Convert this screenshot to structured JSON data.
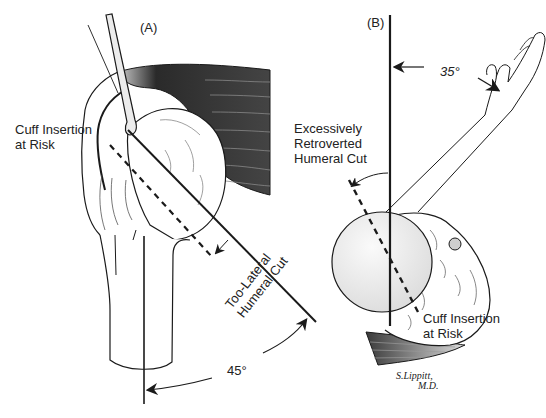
{
  "figure": {
    "panels": [
      {
        "id": "A",
        "label": "(A)",
        "annotations": {
          "cuff_line1": "Cuff Insertion",
          "cuff_line2": "at Risk",
          "cut_line1": "Too-Lateral",
          "cut_line2": "Humeral Cut",
          "angle": "45°"
        }
      },
      {
        "id": "B",
        "label": "(B)",
        "annotations": {
          "retro_line1": "Excessively",
          "retro_line2": "Retroverted",
          "retro_line3": "Humeral Cut",
          "angle": "35°",
          "cuff_line1": "Cuff Insertion",
          "cuff_line2": "at Risk"
        }
      }
    ],
    "signature": {
      "line1": "S.Lippitt,",
      "line2": "M.D."
    },
    "colors": {
      "ink": "#1a1a1a",
      "muscle_dark": "#2a2a2a",
      "muscle_mid": "#6e6e6e",
      "bone_fill": "#ffffff",
      "head_shade": "#e6e6e6"
    }
  }
}
